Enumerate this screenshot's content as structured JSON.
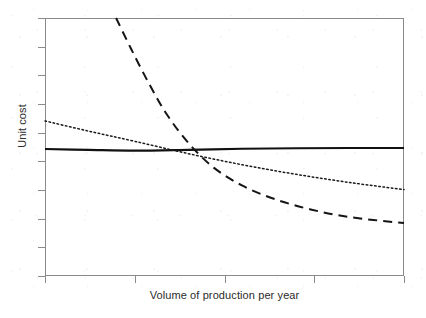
{
  "chart_data": {
    "type": "line",
    "title": "",
    "xlabel": "Volume of production per year",
    "ylabel": "Unit cost",
    "grid": false,
    "legend": "none",
    "tick_labels_shown": false,
    "x_tick_count": 5,
    "y_tick_count": 10,
    "xlim": [
      0,
      100
    ],
    "ylim": [
      0,
      100
    ],
    "series": [
      {
        "name": "constant-unit-cost",
        "style": "solid",
        "linewidth": 2.1,
        "color": "#111111",
        "description": "Flat, essentially constant unit cost across all production volumes",
        "x": [
          0,
          12,
          25,
          40,
          55,
          70,
          85,
          100
        ],
        "y": [
          49.2,
          48.9,
          48.6,
          48.9,
          49.3,
          49.5,
          49.6,
          49.6
        ]
      },
      {
        "name": "gently-declining-unit-cost",
        "style": "dotted",
        "linewidth": 1.5,
        "color": "#1a1a1a",
        "description": "Dotted line falling steadily and gradually with increasing volume",
        "x": [
          0,
          12,
          25,
          40,
          55,
          70,
          85,
          100
        ],
        "y": [
          60.1,
          56.2,
          52.2,
          47.4,
          43.1,
          39.4,
          36.2,
          33.5
        ]
      },
      {
        "name": "steeply-falling-unit-cost",
        "style": "dashed",
        "linewidth": 2.0,
        "color": "#141414",
        "description": "Dashed curve entering at top-left, plunging steeply then flattening asymptotically",
        "x": [
          19.8,
          24,
          29,
          34,
          40,
          47,
          55,
          64,
          74,
          85,
          100
        ],
        "y": [
          100.0,
          88.0,
          74.5,
          62.5,
          51.5,
          42.0,
          35.0,
          29.8,
          25.8,
          22.8,
          20.5
        ]
      }
    ]
  },
  "axes": {
    "x_title": "Volume of production per year",
    "y_title": "Unit cost"
  },
  "frame": {
    "border_color": "#8a8a8a",
    "background": "#ffffff"
  }
}
